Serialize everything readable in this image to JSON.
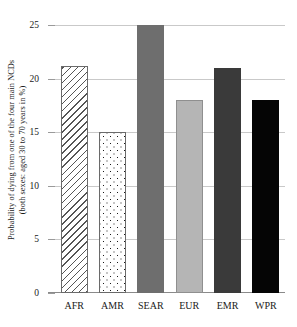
{
  "chart_data": {
    "type": "bar",
    "title": "",
    "subtitle": "",
    "xlabel": "",
    "ylabel_line1": "Probability of dying from one of the four main NCDs",
    "ylabel_line2": "(both sexes: aged 30 to 70 years in %)",
    "categories": [
      "AFR",
      "AMR",
      "SEAR",
      "EUR",
      "EMR",
      "WPR"
    ],
    "values": [
      21.2,
      15.0,
      25.0,
      18.0,
      21.0,
      18.0
    ],
    "ylim": [
      0,
      25
    ],
    "yticks": [
      0,
      5,
      10,
      15,
      20,
      25
    ],
    "ytick_labels": [
      "0",
      "5",
      "10",
      "15",
      "20",
      "25"
    ],
    "grid": true,
    "legend": "none",
    "series": [
      {
        "name": "Probability of dying from one of the four main NCDs",
        "values": [
          21.2,
          15.0,
          25.0,
          18.0,
          21.0,
          18.0
        ]
      }
    ],
    "bar_styles": [
      {
        "category": "AFR",
        "fill": "diagonal-hatch",
        "color": "#ffffff",
        "pattern_color": "#555555",
        "outline": "#6a6a6a"
      },
      {
        "category": "AMR",
        "fill": "dotted",
        "color": "#ffffff",
        "pattern_color": "#1a1a1a",
        "outline": "#6a6a6a"
      },
      {
        "category": "SEAR",
        "fill": "solid",
        "color": "#6e6e6e",
        "pattern_color": "",
        "outline": "#6e6e6e"
      },
      {
        "category": "EUR",
        "fill": "solid",
        "color": "#b5b5b5",
        "pattern_color": "",
        "outline": "#8f8f8f"
      },
      {
        "category": "EMR",
        "fill": "solid",
        "color": "#3a3a3a",
        "pattern_color": "",
        "outline": "#3a3a3a"
      },
      {
        "category": "WPR",
        "fill": "solid",
        "color": "#050505",
        "pattern_color": "",
        "outline": "#050505"
      }
    ],
    "colors": {
      "background": "#ffffff",
      "gridline": "#c9c9c9",
      "axis": "#8a8a8a",
      "text": "#1a1a1a"
    }
  }
}
